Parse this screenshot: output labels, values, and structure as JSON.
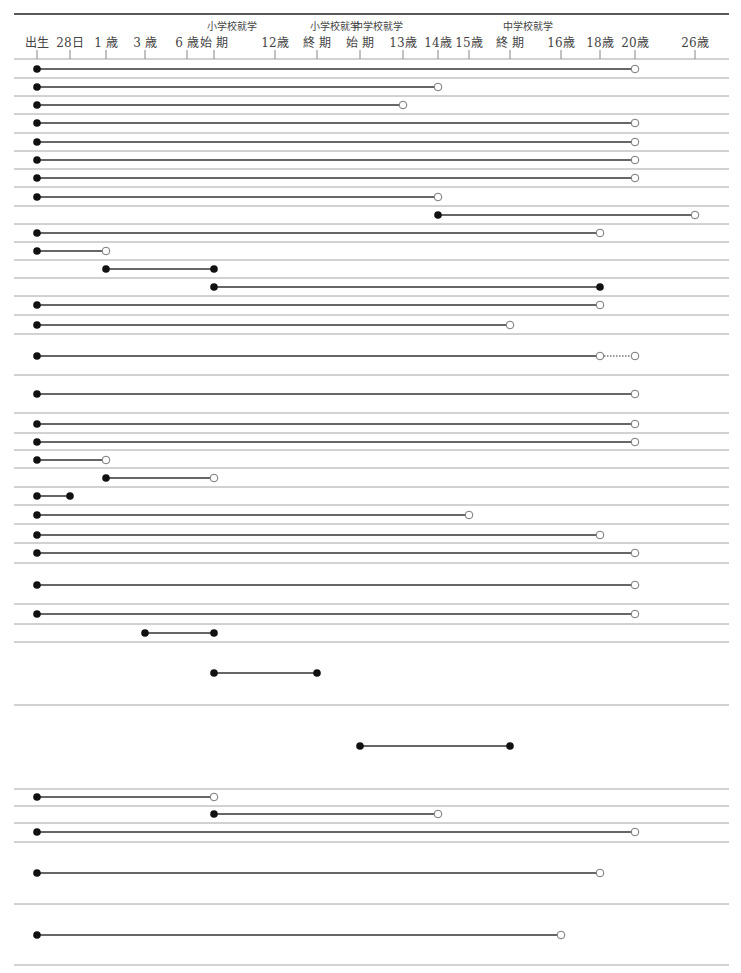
{
  "chart_data": {
    "type": "timeline",
    "title": "",
    "xlabel": "",
    "ylabel": "",
    "axis": {
      "ticks": [
        {
          "key": "birth",
          "label": "出生",
          "x": 37
        },
        {
          "key": "28d",
          "label": "28日",
          "x": 70
        },
        {
          "key": "1y",
          "label": "1 歳",
          "x": 106
        },
        {
          "key": "3y",
          "label": "3 歳",
          "x": 145
        },
        {
          "key": "6y",
          "label": "6 歳",
          "x": 187
        },
        {
          "key": "es_start",
          "label": "始 期",
          "sublabel": "小学校就学",
          "x": 214
        },
        {
          "key": "12y",
          "label": "12歳",
          "x": 275
        },
        {
          "key": "es_end",
          "label": "終 期",
          "sublabel": "小学校就学",
          "x": 317
        },
        {
          "key": "js_start",
          "label": "始 期",
          "sublabel": "中学校就学",
          "x": 360
        },
        {
          "key": "13y",
          "label": "13歳",
          "x": 403
        },
        {
          "key": "14y",
          "label": "14歳",
          "x": 438
        },
        {
          "key": "15y",
          "label": "15歳",
          "x": 469
        },
        {
          "key": "js_end",
          "label": "終 期",
          "sublabel": "中学校就学",
          "x": 510
        },
        {
          "key": "16y",
          "label": "16歳",
          "x": 561
        },
        {
          "key": "18y",
          "label": "18歳",
          "x": 600
        },
        {
          "key": "20y",
          "label": "20歳",
          "x": 635
        },
        {
          "key": "26y",
          "label": "26歳",
          "x": 695
        }
      ]
    },
    "legend": {
      "filled_dot": "included endpoint",
      "open_dot": "excluded endpoint",
      "dotted": "optional extension"
    },
    "dividers": [
      59,
      78,
      96,
      114,
      133,
      151,
      169,
      187,
      206,
      224,
      242,
      260,
      278,
      296,
      315,
      334,
      375,
      413,
      433,
      450,
      468,
      487,
      505,
      524,
      543,
      563,
      604,
      624,
      642,
      705,
      789,
      806,
      823,
      842,
      904,
      965
    ],
    "rows": [
      {
        "y": 69,
        "start": "birth",
        "end": "20y",
        "start_marker": "filled",
        "end_marker": "open"
      },
      {
        "y": 87,
        "start": "birth",
        "end": "14y",
        "start_marker": "filled",
        "end_marker": "open"
      },
      {
        "y": 105,
        "start": "birth",
        "end": "13y",
        "start_marker": "filled",
        "end_marker": "open"
      },
      {
        "y": 123,
        "start": "birth",
        "end": "20y",
        "start_marker": "filled",
        "end_marker": "open"
      },
      {
        "y": 142,
        "start": "birth",
        "end": "20y",
        "start_marker": "filled",
        "end_marker": "open"
      },
      {
        "y": 160,
        "start": "birth",
        "end": "20y",
        "start_marker": "filled",
        "end_marker": "open"
      },
      {
        "y": 178,
        "start": "birth",
        "end": "20y",
        "start_marker": "filled",
        "end_marker": "open"
      },
      {
        "y": 197,
        "start": "birth",
        "end": "14y",
        "start_marker": "filled",
        "end_marker": "open"
      },
      {
        "y": 215,
        "start": "14y",
        "end": "26y",
        "start_marker": "filled",
        "end_marker": "open"
      },
      {
        "y": 233,
        "start": "birth",
        "end": "18y",
        "start_marker": "filled",
        "end_marker": "open"
      },
      {
        "y": 251,
        "start": "birth",
        "end": "1y",
        "start_marker": "filled",
        "end_marker": "open"
      },
      {
        "y": 269,
        "start": "1y",
        "end": "es_start",
        "start_marker": "filled",
        "end_marker": "filled"
      },
      {
        "y": 287,
        "start": "es_start",
        "end": "18y",
        "start_marker": "filled",
        "end_marker": "filled"
      },
      {
        "y": 305,
        "start": "birth",
        "end": "18y",
        "start_marker": "filled",
        "end_marker": "open"
      },
      {
        "y": 325,
        "start": "birth",
        "end": "js_end",
        "start_marker": "filled",
        "end_marker": "open"
      },
      {
        "y": 356,
        "start": "birth",
        "end": "18y",
        "start_marker": "filled",
        "end_marker": "open",
        "extension": {
          "end": "20y",
          "style": "dotted",
          "end_marker": "open"
        }
      },
      {
        "y": 394,
        "start": "birth",
        "end": "20y",
        "start_marker": "filled",
        "end_marker": "open"
      },
      {
        "y": 424,
        "start": "birth",
        "end": "20y",
        "start_marker": "filled",
        "end_marker": "open"
      },
      {
        "y": 442,
        "start": "birth",
        "end": "20y",
        "start_marker": "filled",
        "end_marker": "open"
      },
      {
        "y": 460,
        "start": "birth",
        "end": "1y",
        "start_marker": "filled",
        "end_marker": "open"
      },
      {
        "y": 478,
        "start": "1y",
        "end": "es_start",
        "start_marker": "filled",
        "end_marker": "open"
      },
      {
        "y": 496,
        "start": "birth",
        "end": "28d",
        "start_marker": "filled",
        "end_marker": "filled"
      },
      {
        "y": 515,
        "start": "birth",
        "end": "15y",
        "start_marker": "filled",
        "end_marker": "open"
      },
      {
        "y": 535,
        "start": "birth",
        "end": "18y",
        "start_marker": "filled",
        "end_marker": "open"
      },
      {
        "y": 553,
        "start": "birth",
        "end": "20y",
        "start_marker": "filled",
        "end_marker": "open"
      },
      {
        "y": 585,
        "start": "birth",
        "end": "20y",
        "start_marker": "filled",
        "end_marker": "open"
      },
      {
        "y": 614,
        "start": "birth",
        "end": "20y",
        "start_marker": "filled",
        "end_marker": "open"
      },
      {
        "y": 633,
        "start": "3y",
        "end": "es_start",
        "start_marker": "filled",
        "end_marker": "filled"
      },
      {
        "y": 673,
        "start": "es_start",
        "end": "es_end",
        "start_marker": "filled",
        "end_marker": "filled"
      },
      {
        "y": 746,
        "start": "js_start",
        "end": "js_end",
        "start_marker": "filled",
        "end_marker": "filled"
      },
      {
        "y": 797,
        "start": "birth",
        "end": "es_start",
        "start_marker": "filled",
        "end_marker": "open"
      },
      {
        "y": 814,
        "start": "es_start",
        "end": "14y",
        "start_marker": "filled",
        "end_marker": "open"
      },
      {
        "y": 832,
        "start": "birth",
        "end": "20y",
        "start_marker": "filled",
        "end_marker": "open"
      },
      {
        "y": 873,
        "start": "birth",
        "end": "18y",
        "start_marker": "filled",
        "end_marker": "open"
      },
      {
        "y": 935,
        "start": "birth",
        "end": "16y",
        "start_marker": "filled",
        "end_marker": "open"
      }
    ]
  },
  "colors": {
    "line": "#333333",
    "divider": "#9a9a9a",
    "header_rule": "#222222",
    "dot_fill": "#111111",
    "open_fill": "#ffffff",
    "open_stroke": "#777777"
  }
}
